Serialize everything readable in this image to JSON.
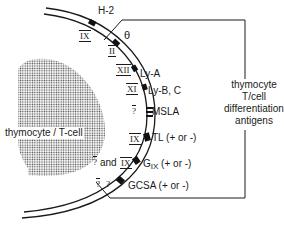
{
  "diagram": {
    "cell_label": "thymocyte / T-cell",
    "group_label_lines": [
      "thymocyte",
      "T/cell",
      "differentiation",
      "antigens"
    ],
    "antigens": [
      {
        "name": "H-2",
        "chromosome": "XVII"
      },
      {
        "name": "θ",
        "chromosome": "II"
      },
      {
        "name": "Ly-A",
        "chromosome": "XII"
      },
      {
        "name": "Ly-B, C",
        "chromosome": "XI"
      },
      {
        "name": "MSLA",
        "chromosome": "?"
      },
      {
        "name": "TL (+ or -)",
        "chromosome": "IX"
      },
      {
        "name": "G IX (+ or -)",
        "chromosome": "? and IX"
      },
      {
        "name": "GCSA (+ or -)",
        "chromosome": "? ?"
      }
    ],
    "chromosome_labels": {
      "h2": "IX",
      "theta": "II",
      "lya": "XII",
      "lyb": "XI",
      "msla": "?",
      "tl": "IX",
      "gix_q": "?",
      "gix_and": "and",
      "gix_ix": "IX",
      "gcsa_q1": "?",
      "gcsa_q2": "?"
    },
    "antigen_labels": {
      "h2": "H-2",
      "theta": "θ",
      "lya": "Ly-A",
      "lyb": "Ly-B, C",
      "msla": "MSLA",
      "tl": "TL (+ or -)",
      "gix_g": "G",
      "gix_sub": "IX",
      "gix_rest": " (+ or -)",
      "gcsa": "GCSA (+ or -)"
    }
  }
}
